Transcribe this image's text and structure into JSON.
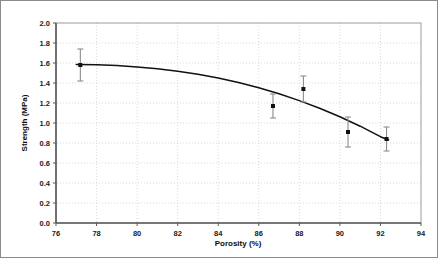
{
  "figure": {
    "border_color": "#8a8a8a",
    "background": "#ffffff"
  },
  "chart_data": {
    "type": "scatter",
    "title": "",
    "subtitle": "",
    "xlabel": "Porosity (%)",
    "ylabel": "Strength (MPa)",
    "xlim": [
      76,
      94
    ],
    "ylim": [
      0.0,
      2.0
    ],
    "xticks": [
      76,
      78,
      80,
      82,
      84,
      86,
      88,
      90,
      92,
      94
    ],
    "yticks": [
      0.0,
      0.2,
      0.4,
      0.6,
      0.8,
      1.0,
      1.2,
      1.4,
      1.6,
      1.8,
      2.0
    ],
    "xtick_labels": [
      "76",
      "78",
      "80",
      "82",
      "84",
      "86",
      "88",
      "90",
      "92",
      "94"
    ],
    "ytick_labels": [
      "0.0",
      "0.2",
      "0.4",
      "0.6",
      "0.8",
      "1.0",
      "1.2",
      "1.4",
      "1.6",
      "1.8",
      "2.0"
    ],
    "grid": {
      "horizontal": true,
      "vertical": true,
      "style": "dotted",
      "color": "#cfcfcf"
    },
    "legend": {
      "visible": false,
      "position": "none"
    },
    "marker": {
      "shape": "square",
      "color": "#111111",
      "size": 4
    },
    "errorbar": {
      "color": "#8c8c8c",
      "cap_width": 6,
      "type": "symmetric-y"
    },
    "series": [
      {
        "name": "Measured strength",
        "type": "scatter",
        "x": [
          77.2,
          86.7,
          88.2,
          90.4,
          92.3
        ],
        "y": [
          1.58,
          1.17,
          1.34,
          0.91,
          0.84
        ],
        "yerr": [
          0.16,
          0.12,
          0.13,
          0.15,
          0.12
        ],
        "y_upper": [
          1.74,
          1.29,
          1.47,
          1.06,
          0.96
        ],
        "y_lower": [
          1.42,
          1.05,
          1.21,
          0.76,
          0.72
        ]
      },
      {
        "name": "Fitted curve",
        "type": "line",
        "color": "#111111",
        "x": [
          77.0,
          78.0,
          79.0,
          80.0,
          81.0,
          82.0,
          83.0,
          84.0,
          85.0,
          86.0,
          87.0,
          88.0,
          89.0,
          90.0,
          91.0,
          92.0,
          92.4
        ],
        "y": [
          1.585,
          1.582,
          1.574,
          1.561,
          1.543,
          1.518,
          1.487,
          1.449,
          1.404,
          1.352,
          1.292,
          1.224,
          1.148,
          1.063,
          0.968,
          0.863,
          0.83
        ]
      }
    ],
    "annotations": []
  }
}
